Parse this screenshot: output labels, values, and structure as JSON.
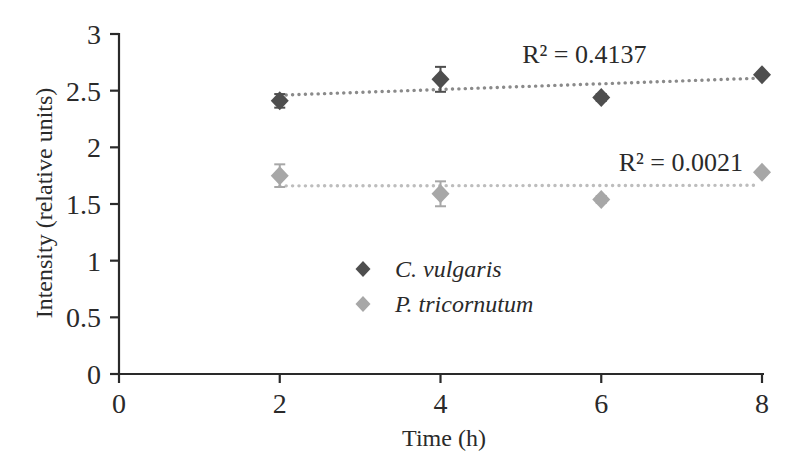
{
  "figure": {
    "background": "#ffffff",
    "axis_color": "#2a2a2a",
    "text_color": "#2a2a2a"
  },
  "chart_data": {
    "type": "scatter",
    "title": "",
    "xlabel": "Time (h)",
    "ylabel": "Intensity (relative units)",
    "xlim": [
      0,
      8
    ],
    "ylim": [
      0,
      3
    ],
    "xticks": [
      "0",
      "2",
      "4",
      "6",
      "8"
    ],
    "yticks": [
      "0",
      "0.5",
      "1",
      "1.5",
      "2",
      "2.5",
      "3"
    ],
    "grid": false,
    "legend_position": "inside lower-center",
    "x": [
      2,
      4,
      6,
      8
    ],
    "series": [
      {
        "name": "C. vulgaris",
        "marker": "diamond",
        "color": "#4e4e4e",
        "values": [
          2.41,
          2.6,
          2.44,
          2.64
        ],
        "errors": [
          0.06,
          0.11,
          0.03,
          0.02
        ],
        "trendline": {
          "style": "dotted",
          "color": "#8a8a8a",
          "start_y": 2.46,
          "end_y": 2.61,
          "annotation": "R² = 0.4137",
          "annotation_xy": [
            5.79,
            2.82
          ]
        }
      },
      {
        "name": "P. tricornutum",
        "marker": "diamond",
        "color": "#a7a7a7",
        "values": [
          1.75,
          1.59,
          1.54,
          1.78
        ],
        "errors": [
          0.1,
          0.11,
          0.03,
          0.02
        ],
        "trendline": {
          "style": "dotted",
          "color": "#bdbdbd",
          "start_y": 1.66,
          "end_y": 1.665,
          "annotation": "R² = 0.0021",
          "annotation_xy": [
            6.99,
            1.87
          ]
        }
      }
    ]
  }
}
